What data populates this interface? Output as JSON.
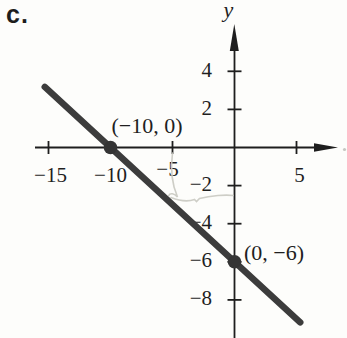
{
  "figure_label": "c.",
  "axes": {
    "y_axis_label": "y",
    "x_tick_labels": [
      "−15",
      "−10",
      "−5",
      "5"
    ],
    "y_tick_labels": [
      "4",
      "2",
      "−2",
      "−4",
      "−6",
      "−8"
    ]
  },
  "chart_data": {
    "type": "line",
    "title": "",
    "xlabel": "",
    "ylabel": "y",
    "grid": false,
    "xlim": [
      -17.6,
      8.6
    ],
    "ylim": [
      -10,
      6.4
    ],
    "x_ticks": [
      {
        "value": -15,
        "label": "−15"
      },
      {
        "value": -10,
        "label": "−10"
      },
      {
        "value": -5,
        "label": "−5"
      },
      {
        "value": 5,
        "label": "5"
      }
    ],
    "y_ticks": [
      {
        "value": 4,
        "label": "4"
      },
      {
        "value": 2,
        "label": "2"
      },
      {
        "value": -2,
        "label": "−2"
      },
      {
        "value": -4,
        "label": "−4"
      },
      {
        "value": -6,
        "label": "−6"
      },
      {
        "value": -8,
        "label": "−8"
      }
    ],
    "series": [
      {
        "name": "line-through-points",
        "slope": -0.6,
        "y_intercept": -6,
        "x_intercept": -10,
        "draw_extent_x": [
          -15.3,
          5.3
        ],
        "points": [
          {
            "x": -10,
            "y": 0,
            "label": "(−10, 0)"
          },
          {
            "x": 0,
            "y": -6,
            "label": "(0, −6)"
          }
        ]
      }
    ],
    "annotations": [
      {
        "type": "pencil-mark",
        "description": "faint handwritten vertical stroke from the −5 tick down to the line"
      },
      {
        "type": "pencil-mark",
        "description": "faint handwritten horizontal stroke from the line across to the y-axis near y = −2.7"
      }
    ]
  }
}
